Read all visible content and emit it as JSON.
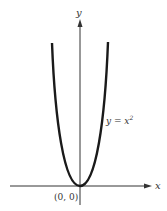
{
  "diagram": {
    "type": "parabola-graph",
    "equation_lhs": "y = x",
    "equation_exp": "2",
    "origin_label": "(0, 0)",
    "x_axis_label": "x",
    "y_axis_label": "y",
    "curve_color": "#1a1a1a",
    "axis_color": "#333333"
  }
}
